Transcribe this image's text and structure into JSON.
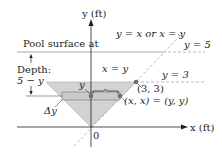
{
  "figure": {
    "type": "pool cross-section diagram",
    "axes": {
      "y_label": "y (ft)",
      "x_label": "x (ft)",
      "origin_label": "0"
    },
    "labels": {
      "pool_surface": "Pool surface at",
      "surface_line": "y = 5",
      "depth_title": "Depth:",
      "depth_expr": "5 − y",
      "line_y3": "y = 3",
      "diagonal": "y = x or x = y",
      "half_width": "x = y",
      "strip_y": "y",
      "delta_y": "Δy",
      "corner_point": "(3, 3)",
      "edge_point": "(x, x) = (y, y)"
    },
    "colors": {
      "shading": "#d1d3d4",
      "strip": "#bcbec0",
      "lines": "#231f20",
      "surface": "#a7a9ac",
      "points": "#6d6e71"
    }
  }
}
